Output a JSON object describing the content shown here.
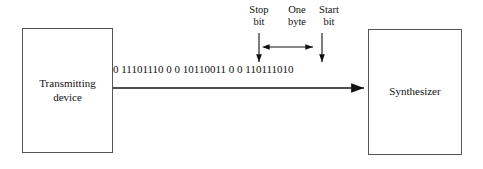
{
  "diagram": {
    "colors": {
      "stroke": "#555555",
      "text": "#111111",
      "background": "#ffffff"
    },
    "boxes": {
      "transmitting": {
        "label": "Transmitting\ndevice"
      },
      "synthesizer": {
        "label": "Synthesizer"
      }
    },
    "bit_stream": {
      "value": "0 11101110 0 0 10110011 0 0 110111010"
    },
    "callouts": {
      "stop_bit": {
        "label": "Stop\nbit"
      },
      "one_byte": {
        "label": "One\nbyte"
      },
      "start_bit": {
        "label": "Start\nbit"
      }
    }
  }
}
